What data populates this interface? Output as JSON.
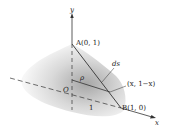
{
  "figure": {
    "axes": {
      "x_label": "x",
      "y_label": "y"
    },
    "points": {
      "A": "A(0, 1)",
      "B": "B(1, 0)",
      "origin": "O",
      "general": "(x, 1−x)"
    },
    "annotations": {
      "radius": "ρ",
      "arc_length": "ds",
      "unit_length": "1"
    },
    "colors": {
      "line": "#333333",
      "cone_shade": "#b8b8b8",
      "background": "#ffffff"
    }
  }
}
